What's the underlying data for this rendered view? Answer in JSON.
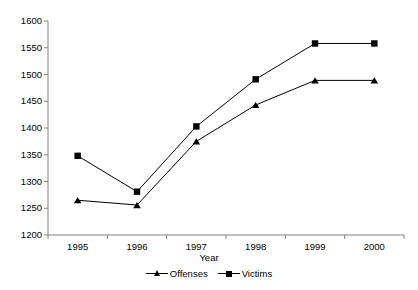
{
  "chart_data": {
    "type": "line",
    "title": "",
    "xlabel": "Year",
    "ylabel": "",
    "categories": [
      "1995",
      "1996",
      "1997",
      "1998",
      "1999",
      "2000"
    ],
    "ylim": [
      1200,
      1600
    ],
    "yticks": [
      "1200",
      "1250",
      "1300",
      "1350",
      "1400",
      "1450",
      "1500",
      "1550",
      "1600"
    ],
    "ytick_values": [
      1200,
      1250,
      1300,
      1350,
      1400,
      1450,
      1500,
      1550,
      1600
    ],
    "grid": false,
    "legend_position": "bottom",
    "series": [
      {
        "name": "Offenses",
        "marker": "triangle",
        "values": [
          1265,
          1256,
          1375,
          1443,
          1489,
          1489
        ]
      },
      {
        "name": "Victims",
        "marker": "square",
        "values": [
          1348,
          1281,
          1403,
          1491,
          1558,
          1558
        ]
      }
    ]
  },
  "colors": {
    "line": "#000000",
    "axis": "#808080",
    "text": "#000000",
    "background": "#ffffff"
  }
}
